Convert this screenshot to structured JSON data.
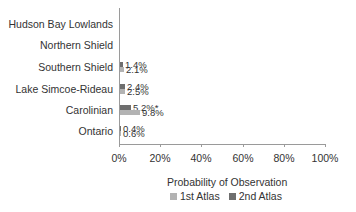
{
  "chart_data": {
    "type": "bar",
    "orientation": "horizontal",
    "title": "",
    "xlabel": "Probability of Observation",
    "ylabel": "",
    "xlim": [
      0,
      100
    ],
    "x_ticks": [
      "0%",
      "20%",
      "40%",
      "60%",
      "80%",
      "100%"
    ],
    "categories": [
      "Hudson Bay Lowlands",
      "Northern Shield",
      "Southern Shield",
      "Lake Simcoe-Rideau",
      "Carolinian",
      "Ontario"
    ],
    "series": [
      {
        "name": "1st Atlas",
        "color": "#b3b3b3",
        "values": [
          null,
          null,
          2.1,
          2.5,
          9.8,
          0.6
        ],
        "labels": [
          "",
          "",
          "2.1%",
          "2.5%",
          "9.8%",
          "0.6%"
        ]
      },
      {
        "name": "2nd Atlas",
        "color": "#6e6e6e",
        "values": [
          null,
          null,
          1.4,
          2.4,
          5.2,
          0.4
        ],
        "labels": [
          "",
          "",
          "1.4%",
          "2.4%",
          "5.2%*",
          "0.4%"
        ]
      }
    ],
    "annotations": [
      "* on Carolinian 2nd Atlas value"
    ],
    "grid": false,
    "legend_position": "bottom"
  },
  "legend": {
    "s1": "1st Atlas",
    "s2": "2nd Atlas"
  }
}
